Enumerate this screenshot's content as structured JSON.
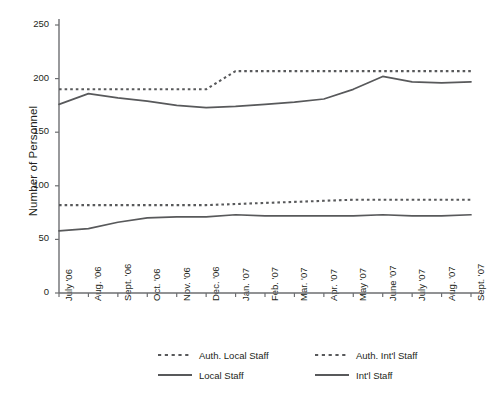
{
  "chart_data": {
    "type": "line",
    "title": "",
    "xlabel": "",
    "ylabel": "Number of Personnel",
    "ylim": [
      0,
      250
    ],
    "yticks": [
      0,
      50,
      100,
      150,
      200,
      250
    ],
    "grid": false,
    "legend_position": "bottom",
    "categories": [
      "July '06",
      "Aug. '06",
      "Sept. '06",
      "Oct. '06",
      "Nov. '06",
      "Dec. '06",
      "Jan. '07",
      "Feb. '07",
      "Mar. '07",
      "Apr. '07",
      "May '07",
      "June '07",
      "July '07",
      "Aug. '07",
      "Sept. '07"
    ],
    "series": [
      {
        "name": "Auth. Local Staff",
        "style": "dashed",
        "color": "#58595b",
        "values": [
          82,
          82,
          82,
          82,
          82,
          82,
          83,
          84,
          85,
          86,
          87,
          87,
          87,
          87,
          87
        ]
      },
      {
        "name": "Auth. Int'l  Staff",
        "style": "dashed",
        "color": "#58595b",
        "values": [
          190,
          190,
          190,
          190,
          190,
          190,
          207,
          207,
          207,
          207,
          207,
          207,
          207,
          207,
          207
        ]
      },
      {
        "name": "Local Staff",
        "style": "solid",
        "color": "#58595b",
        "values": [
          176,
          186,
          182,
          179,
          175,
          173,
          174,
          176,
          178,
          181,
          190,
          202,
          197,
          196,
          197
        ]
      },
      {
        "name": "Int'l Staff",
        "style": "solid",
        "color": "#58595b",
        "values": [
          58,
          60,
          66,
          70,
          71,
          71,
          73,
          72,
          72,
          72,
          72,
          73,
          72,
          72,
          73
        ]
      }
    ]
  },
  "legend": {
    "entries": [
      {
        "label": "Auth. Local Staff",
        "style": "dashed"
      },
      {
        "label": "Auth. Int'l  Staff",
        "style": "dashed"
      },
      {
        "label": "Local Staff",
        "style": "solid"
      },
      {
        "label": "Int'l Staff",
        "style": "solid"
      }
    ]
  },
  "colors": {
    "line": "#58595b",
    "axis": "#6d6e71",
    "text": "#231f20",
    "background": "#ffffff"
  }
}
